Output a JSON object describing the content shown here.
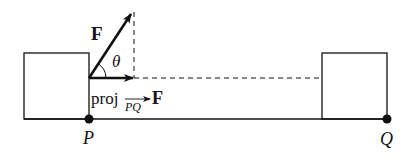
{
  "diagram": {
    "labels": {
      "force": "F",
      "angle": "θ",
      "proj_prefix": "proj",
      "proj_subscript": "PQ",
      "proj_vector": "F",
      "point_p": "P",
      "point_q": "Q"
    },
    "colors": {
      "stroke": "#111111",
      "background": "#ffffff"
    }
  }
}
